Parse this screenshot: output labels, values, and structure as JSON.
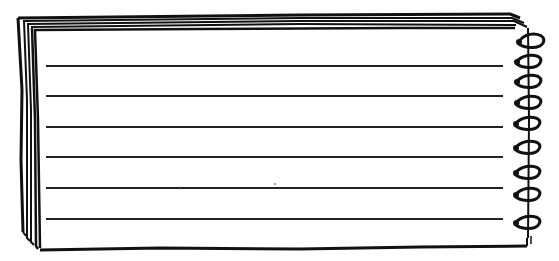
{
  "illustration": {
    "subject": "spiral notepad",
    "ruled_lines": 6,
    "spiral_rings": 9,
    "ink_color": "#111111",
    "paper_color": "#ffffff"
  }
}
